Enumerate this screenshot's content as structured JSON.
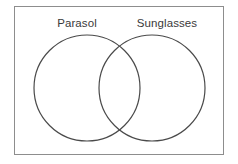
{
  "figure": {
    "type": "venn-diagram",
    "set_count": 2,
    "frame": {
      "visible": true,
      "border_color": "#8d8d8d",
      "background_color": "#ffffff"
    },
    "stroke_color": "#4a4a4a",
    "label_color": "#3a3a3a",
    "fill": "none",
    "sets": [
      {
        "id": "left",
        "label": "Parasol",
        "cx": 87,
        "cy": 88,
        "r": 53
      },
      {
        "id": "right",
        "label": "Sunglasses",
        "cx": 152,
        "cy": 88,
        "r": 53
      }
    ],
    "regions": {
      "left_only": "",
      "intersection": "",
      "right_only": ""
    }
  }
}
